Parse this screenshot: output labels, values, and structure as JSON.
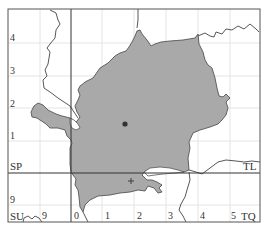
{
  "map": {
    "type": "grid distribution map",
    "frame": {
      "x": 8,
      "y": 9,
      "width": 252,
      "height": 213
    },
    "colors": {
      "frame": "#555555",
      "major_grid": "#333333",
      "minor_grid": "#e4e4e4",
      "area_fill": "#a9a9a9",
      "area_outline": "#555555",
      "boundary_line": "#444444",
      "label": "#333333"
    },
    "grid_squares": {
      "top_left": "SP",
      "top_right": "TL",
      "bottom_left": "SU",
      "bottom_right": "TQ"
    },
    "left_axis_ticks": [
      {
        "label": "4",
        "y": 37
      },
      {
        "label": "3",
        "y": 71
      },
      {
        "label": "2",
        "y": 103
      },
      {
        "label": "1",
        "y": 136
      },
      {
        "label": "9",
        "y": 200
      }
    ],
    "bottom_axis_ticks": [
      {
        "label": "9",
        "x": 45
      },
      {
        "label": "0",
        "x": 76
      },
      {
        "label": "1",
        "x": 107
      },
      {
        "label": "2",
        "x": 139
      },
      {
        "label": "3",
        "x": 171
      },
      {
        "label": "4",
        "x": 203
      },
      {
        "label": "5",
        "x": 234
      }
    ],
    "markers": [
      {
        "type": "dot",
        "x": 125,
        "y": 124,
        "label": "record-dot"
      },
      {
        "type": "cross",
        "x": 131,
        "y": 181,
        "label": "record-cross"
      }
    ]
  }
}
